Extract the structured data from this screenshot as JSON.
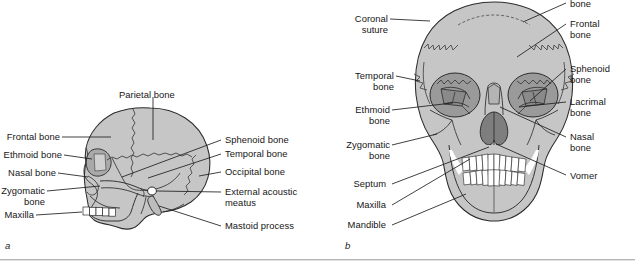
{
  "figure": {
    "type": "anatomical-illustration",
    "panels": [
      {
        "id": "a",
        "letter": "a",
        "view": "lateral",
        "labels": [
          {
            "text": "Parietal bone",
            "side": "top"
          },
          {
            "text": "Frontal bone",
            "side": "left"
          },
          {
            "text": "Ethmoid bone",
            "side": "left"
          },
          {
            "text": "Nasal bone",
            "side": "left"
          },
          {
            "text": "Zygomatic\nbone",
            "side": "left"
          },
          {
            "text": "Maxilla",
            "side": "left"
          },
          {
            "text": "Sphenoid bone",
            "side": "right"
          },
          {
            "text": "Temporal bone",
            "side": "right"
          },
          {
            "text": "Occipital bone",
            "side": "right"
          },
          {
            "text": "External acoustic\nmeatus",
            "side": "right"
          },
          {
            "text": "Mastoid process",
            "side": "right"
          }
        ]
      },
      {
        "id": "b",
        "letter": "b",
        "view": "anterior",
        "labels": [
          {
            "text": "Coronal\nsuture",
            "side": "left"
          },
          {
            "text": "Temporal\nbone",
            "side": "left"
          },
          {
            "text": "Ethmoid\nbone",
            "side": "left"
          },
          {
            "text": "Zygomatic\nbone",
            "side": "left"
          },
          {
            "text": "Septum",
            "side": "left"
          },
          {
            "text": "Maxilla",
            "side": "left"
          },
          {
            "text": "Mandible",
            "side": "left"
          },
          {
            "text": "bone",
            "side": "right",
            "note": "clipped at top edge"
          },
          {
            "text": "Frontal\nbone",
            "side": "right"
          },
          {
            "text": "Sphenoid\nbone",
            "side": "right"
          },
          {
            "text": "Lacrimal\nbone",
            "side": "right"
          },
          {
            "text": "Nasal\nbone",
            "side": "right"
          },
          {
            "text": "Vomer",
            "side": "right"
          }
        ]
      }
    ]
  },
  "panel_a": {
    "letter": "a",
    "parietal": "Parietal bone",
    "frontal": "Frontal bone",
    "ethmoid": "Ethmoid bone",
    "nasal": "Nasal bone",
    "zygomatic": "Zygomatic\nbone",
    "maxilla": "Maxilla",
    "sphenoid": "Sphenoid bone",
    "temporal": "Temporal bone",
    "occipital": "Occipital bone",
    "meatus": "External acoustic\nmeatus",
    "mastoid": "Mastoid process"
  },
  "panel_b": {
    "letter": "b",
    "coronal": "Coronal\nsuture",
    "temporal": "Temporal\nbone",
    "ethmoid": "Ethmoid\nbone",
    "zygomatic": "Zygomatic\nbone",
    "septum": "Septum",
    "maxilla": "Maxilla",
    "mandible": "Mandible",
    "parietal_clipped": "bone",
    "frontal": "Frontal\nbone",
    "sphenoid": "Sphenoid\nbone",
    "lacrimal": "Lacrimal\nbone",
    "nasal": "Nasal\nbone",
    "vomer": "Vomer"
  },
  "colors": {
    "background": "#ffffff",
    "bone_fill": "#c6c6c6",
    "bone_fill_light": "#d2d2d2",
    "orbit_fill": "#9a9a9a",
    "orbit_deep": "#8a8a8a",
    "nasal_cavity": "#7e7e7e",
    "outline": "#2b2b2b",
    "suture": "#4a4a4a",
    "teeth": "#ffffff",
    "leader": "#1f1f1f",
    "text": "#161616",
    "rule": "#b4b4b4"
  }
}
